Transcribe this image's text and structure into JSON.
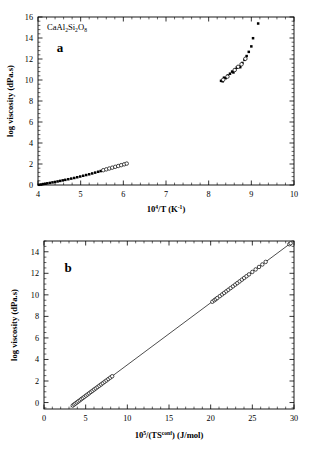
{
  "figure": {
    "panels": [
      {
        "letter": "a",
        "sample_label": "CaAl2Si2O8",
        "sample_label_parts": {
          "p1": "CaAl",
          "s1": "2",
          "p2": "Si",
          "s2": "2",
          "p3": "O",
          "s3": "8"
        },
        "xlabel_parts": {
          "base": "10",
          "exp": "4",
          "mid": "/T  (K",
          "exp2": "-1",
          "tail": ")"
        },
        "ylabel": "log viscosity  (dPa.s)"
      },
      {
        "letter": "b",
        "xlabel_parts": {
          "base": "10",
          "exp": "5",
          "mid": "/(TS",
          "exp2": "conf",
          "tail": ")  (J/mol)"
        },
        "ylabel": "log viscosity  (dPa.s)"
      }
    ]
  },
  "chart_data": [
    {
      "type": "scatter",
      "panel": "a",
      "title": "",
      "xlabel": "10^4/T  (K^-1)",
      "ylabel": "log viscosity  (dPa.s)",
      "xlim": [
        4,
        10
      ],
      "ylim": [
        0,
        16
      ],
      "xticks": [
        4,
        5,
        6,
        7,
        8,
        9,
        10
      ],
      "xtick_labels": [
        "4",
        "5",
        "6",
        "7",
        "8",
        "9",
        "10"
      ],
      "yticks": [
        0,
        2,
        4,
        6,
        8,
        10,
        12,
        14,
        16
      ],
      "ytick_labels": [
        "0",
        "2",
        "4",
        "6",
        "8",
        "10",
        "12",
        "14",
        "16"
      ],
      "xminor_step": 0.2,
      "yminor_step": 0.4,
      "grid": false,
      "legend": null,
      "annotations": [
        {
          "text": "CaAl2Si2O8",
          "x": 4.12,
          "y": 15.3
        },
        {
          "text": "a",
          "x": 4.55,
          "y": 13.3
        }
      ],
      "series": [
        {
          "name": "low-viscosity superliquidus (filled squares)",
          "marker": "filled-square",
          "points": [
            [
              4.02,
              0.02
            ],
            [
              4.07,
              0.05
            ],
            [
              4.12,
              0.09
            ],
            [
              4.17,
              0.12
            ],
            [
              4.22,
              0.16
            ],
            [
              4.28,
              0.2
            ],
            [
              4.34,
              0.25
            ],
            [
              4.4,
              0.29
            ],
            [
              4.46,
              0.34
            ],
            [
              4.52,
              0.39
            ],
            [
              4.58,
              0.44
            ],
            [
              4.64,
              0.49
            ],
            [
              4.71,
              0.55
            ],
            [
              4.78,
              0.61
            ],
            [
              4.85,
              0.67
            ],
            [
              4.92,
              0.74
            ],
            [
              4.99,
              0.81
            ],
            [
              5.06,
              0.88
            ],
            [
              5.13,
              0.95
            ],
            [
              5.2,
              1.02
            ],
            [
              5.27,
              1.1
            ],
            [
              5.34,
              1.18
            ],
            [
              5.41,
              1.26
            ],
            [
              5.47,
              1.33
            ]
          ]
        },
        {
          "name": "low-viscosity extension (open circles)",
          "marker": "open-circle",
          "points": [
            [
              5.53,
              1.41
            ],
            [
              5.6,
              1.49
            ],
            [
              5.67,
              1.57
            ],
            [
              5.74,
              1.65
            ],
            [
              5.81,
              1.73
            ],
            [
              5.88,
              1.81
            ],
            [
              5.95,
              1.89
            ],
            [
              6.02,
              1.97
            ],
            [
              6.08,
              2.04
            ]
          ]
        },
        {
          "name": "high-viscosity near-Tg (filled squares)",
          "marker": "filled-square",
          "points": [
            [
              8.29,
              9.92
            ],
            [
              8.33,
              9.88
            ],
            [
              8.36,
              10.22
            ],
            [
              8.4,
              10.18
            ],
            [
              8.45,
              10.42
            ],
            [
              8.5,
              10.6
            ],
            [
              8.55,
              10.8
            ],
            [
              8.58,
              10.72
            ],
            [
              8.62,
              11.02
            ],
            [
              8.66,
              11.18
            ],
            [
              8.7,
              11.3
            ],
            [
              8.74,
              11.22
            ],
            [
              8.79,
              11.62
            ],
            [
              8.84,
              11.92
            ],
            [
              8.89,
              12.28
            ],
            [
              8.94,
              12.68
            ],
            [
              9.0,
              13.2
            ],
            [
              9.04,
              13.98
            ],
            [
              9.16,
              15.38
            ]
          ]
        },
        {
          "name": "high-viscosity near-Tg (open symbols)",
          "marker": "open-circle",
          "points": [
            [
              8.34,
              10.02
            ],
            [
              8.44,
              10.32
            ],
            [
              8.61,
              10.95
            ],
            [
              8.69,
              11.26
            ],
            [
              8.77,
              11.5
            ],
            [
              8.86,
              12.02
            ]
          ]
        }
      ]
    },
    {
      "type": "scatter",
      "panel": "b",
      "title": "",
      "xlabel": "10^5/(TS^conf)  (J/mol)",
      "ylabel": "log viscosity  (dPa.s)",
      "xlim": [
        0,
        30
      ],
      "ylim": [
        -0.6,
        15
      ],
      "xticks": [
        0,
        5,
        10,
        15,
        20,
        25,
        30
      ],
      "xtick_labels": [
        "0",
        "5",
        "10",
        "15",
        "20",
        "25",
        "30"
      ],
      "yticks": [
        0,
        2,
        4,
        6,
        8,
        10,
        12,
        14
      ],
      "ytick_labels": [
        "0",
        "2",
        "4",
        "6",
        "8",
        "10",
        "12",
        "14"
      ],
      "xminor_step": 1,
      "yminor_step": 0.5,
      "grid": false,
      "legend": null,
      "annotations": [
        {
          "text": "b",
          "x": 3.6,
          "y": 13.6
        }
      ],
      "fit_line": {
        "name": "Adam-Gibbs linear fit",
        "x_start": 3.2,
        "y_start": -0.42,
        "x_end": 29.7,
        "y_end": 14.85
      },
      "series": [
        {
          "name": "all viscosity data (open circles)",
          "marker": "open-circle",
          "points": [
            [
              3.45,
              -0.28
            ],
            [
              3.62,
              -0.18
            ],
            [
              3.78,
              -0.09
            ],
            [
              3.95,
              0.01
            ],
            [
              4.12,
              0.11
            ],
            [
              4.3,
              0.21
            ],
            [
              4.48,
              0.32
            ],
            [
              4.66,
              0.42
            ],
            [
              4.85,
              0.53
            ],
            [
              5.04,
              0.64
            ],
            [
              5.23,
              0.75
            ],
            [
              5.42,
              0.86
            ],
            [
              5.62,
              0.98
            ],
            [
              5.82,
              1.09
            ],
            [
              6.02,
              1.21
            ],
            [
              6.22,
              1.32
            ],
            [
              6.43,
              1.44
            ],
            [
              6.64,
              1.56
            ],
            [
              6.85,
              1.68
            ],
            [
              7.06,
              1.8
            ],
            [
              7.28,
              1.93
            ],
            [
              7.5,
              2.05
            ],
            [
              7.72,
              2.18
            ],
            [
              7.95,
              2.31
            ],
            [
              8.18,
              2.44
            ],
            [
              20.2,
              9.36
            ],
            [
              20.45,
              9.5
            ],
            [
              20.62,
              9.6
            ],
            [
              20.8,
              9.71
            ],
            [
              21.1,
              9.88
            ],
            [
              21.38,
              10.04
            ],
            [
              21.62,
              10.18
            ],
            [
              21.88,
              10.33
            ],
            [
              22.12,
              10.47
            ],
            [
              22.4,
              10.63
            ],
            [
              22.68,
              10.79
            ],
            [
              22.95,
              10.95
            ],
            [
              23.2,
              11.09
            ],
            [
              23.48,
              11.25
            ],
            [
              23.75,
              11.41
            ],
            [
              24.02,
              11.57
            ],
            [
              24.3,
              11.73
            ],
            [
              24.6,
              11.9
            ],
            [
              25.0,
              12.13
            ],
            [
              25.4,
              12.36
            ],
            [
              25.8,
              12.59
            ],
            [
              26.2,
              12.82
            ],
            [
              26.6,
              13.06
            ],
            [
              29.45,
              14.7
            ],
            [
              29.6,
              14.79
            ]
          ]
        }
      ]
    }
  ]
}
